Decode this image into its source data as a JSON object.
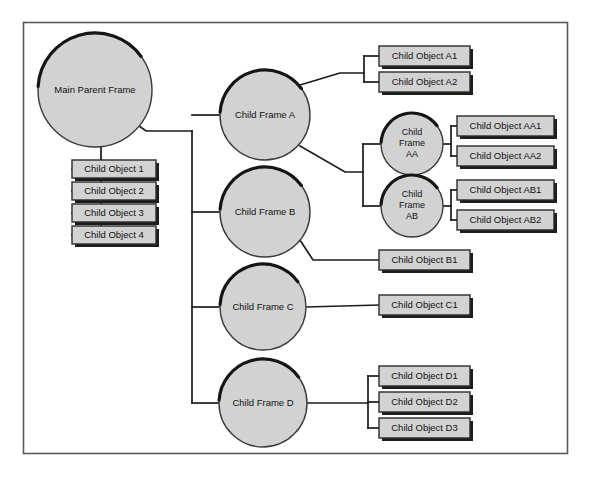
{
  "canvas": {
    "width": 591,
    "height": 477,
    "background_color": "#ffffff",
    "border_color": "#555a60"
  },
  "style": {
    "node_fill": "#d2d2d2",
    "node_stroke": "#2b2b2b",
    "arc_highlight": "#151515",
    "connector_color": "#1a1a1a",
    "text_color": "#111111"
  },
  "diagram": {
    "root": {
      "id": "main-parent-frame",
      "label": "Main Parent Frame",
      "shape": "circle",
      "cx": 95,
      "cy": 90,
      "r": 57
    },
    "root_objects": [
      {
        "id": "child-object-1",
        "label": "Child Object 1",
        "shape": "box",
        "x": 72,
        "y": 160,
        "w": 84,
        "h": 18
      },
      {
        "id": "child-object-2",
        "label": "Child Object 2",
        "shape": "box",
        "x": 72,
        "y": 182,
        "w": 84,
        "h": 18
      },
      {
        "id": "child-object-3",
        "label": "Child Object 3",
        "shape": "box",
        "x": 72,
        "y": 204,
        "w": 84,
        "h": 18
      },
      {
        "id": "child-object-4",
        "label": "Child Object 4",
        "shape": "box",
        "x": 72,
        "y": 226,
        "w": 84,
        "h": 18
      }
    ],
    "child_frames": [
      {
        "id": "child-frame-a",
        "label": "Child Frame A",
        "shape": "circle",
        "cx": 265,
        "cy": 115,
        "r": 45
      },
      {
        "id": "child-frame-b",
        "label": "Child Frame B",
        "shape": "circle",
        "cx": 265,
        "cy": 212,
        "r": 45
      },
      {
        "id": "child-frame-c",
        "label": "Child Frame C",
        "shape": "circle",
        "cx": 263,
        "cy": 307,
        "r": 43
      },
      {
        "id": "child-frame-d",
        "label": "Child Frame D",
        "shape": "circle",
        "cx": 263,
        "cy": 403,
        "r": 44
      }
    ],
    "sub_frames": [
      {
        "id": "child-frame-aa",
        "label_lines": [
          "Child",
          "Frame",
          "AA"
        ],
        "shape": "circle",
        "cx": 412,
        "cy": 144,
        "r": 31
      },
      {
        "id": "child-frame-ab",
        "label_lines": [
          "Child",
          "Frame",
          "AB"
        ],
        "shape": "circle",
        "cx": 412,
        "cy": 206,
        "r": 31
      }
    ],
    "leaf_objects": [
      {
        "id": "child-object-a1",
        "label": "Child Object A1",
        "shape": "box",
        "x": 379,
        "y": 46,
        "w": 91,
        "h": 20,
        "parent": "child-frame-a"
      },
      {
        "id": "child-object-a2",
        "label": "Child Object A2",
        "shape": "box",
        "x": 379,
        "y": 72,
        "w": 91,
        "h": 20,
        "parent": "child-frame-a"
      },
      {
        "id": "child-object-aa1",
        "label": "Child Object AA1",
        "shape": "box",
        "x": 457,
        "y": 116,
        "w": 97,
        "h": 20,
        "parent": "child-frame-aa"
      },
      {
        "id": "child-object-aa2",
        "label": "Child Object AA2",
        "shape": "box",
        "x": 457,
        "y": 146,
        "w": 97,
        "h": 20,
        "parent": "child-frame-aa"
      },
      {
        "id": "child-object-ab1",
        "label": "Child Object AB1",
        "shape": "box",
        "x": 457,
        "y": 180,
        "w": 97,
        "h": 20,
        "parent": "child-frame-ab"
      },
      {
        "id": "child-object-ab2",
        "label": "Child Object AB2",
        "shape": "box",
        "x": 457,
        "y": 210,
        "w": 97,
        "h": 20,
        "parent": "child-frame-ab"
      },
      {
        "id": "child-object-b1",
        "label": "Child Object B1",
        "shape": "box",
        "x": 379,
        "y": 250,
        "w": 91,
        "h": 20,
        "parent": "child-frame-b"
      },
      {
        "id": "child-object-c1",
        "label": "Child Object C1",
        "shape": "box",
        "x": 379,
        "y": 295,
        "w": 91,
        "h": 20,
        "parent": "child-frame-c"
      },
      {
        "id": "child-object-d1",
        "label": "Child Object D1",
        "shape": "box",
        "x": 379,
        "y": 366,
        "w": 91,
        "h": 20,
        "parent": "child-frame-d"
      },
      {
        "id": "child-object-d2",
        "label": "Child Object D2",
        "shape": "box",
        "x": 379,
        "y": 392,
        "w": 91,
        "h": 20,
        "parent": "child-frame-d"
      },
      {
        "id": "child-object-d3",
        "label": "Child Object D3",
        "shape": "box",
        "x": 379,
        "y": 418,
        "w": 91,
        "h": 20,
        "parent": "child-frame-d"
      }
    ],
    "connector_paths": [
      "M 128 118 L 146 131 L 192 131",
      "M 192 131 L 192 403",
      "M 192 115 L 220 115",
      "M 192 212 L 220 212",
      "M 192 307 L 220 307",
      "M 192 403 L 219 403",
      "M 101 147 L 101 169 L 72 169",
      "M 101 191 L 72 191",
      "M 101 213 L 72 213",
      "M 101 235 L 72 235",
      "M 101 169 L 101 235",
      "M 300 85 L 340 73 L 364 73",
      "M 364 56 L 364 82",
      "M 364 56 L 379 56",
      "M 364 82 L 379 82",
      "M 300 146 L 345 172 L 363 172",
      "M 363 144 L 363 206",
      "M 363 144 L 381 144",
      "M 363 206 L 381 206",
      "M 443 144 L 451 144",
      "M 451 126 L 451 156",
      "M 451 126 L 457 126",
      "M 451 156 L 457 156",
      "M 443 206 L 451 206",
      "M 451 190 L 451 220",
      "M 451 190 L 457 190",
      "M 451 220 L 457 220",
      "M 296 234 L 313 260 L 379 260",
      "M 306 307 L 379 305",
      "M 307 403 L 368 403",
      "M 368 376 L 368 428",
      "M 368 376 L 379 376",
      "M 368 402 L 379 402",
      "M 368 428 L 379 428"
    ]
  }
}
